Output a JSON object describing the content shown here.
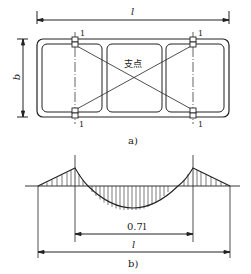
{
  "figure_a": {
    "caption": "a)",
    "length_label": "l",
    "width_label": "b",
    "support_label": "支点",
    "support_markers": [
      "1",
      "1",
      "1",
      "1"
    ]
  },
  "figure_b": {
    "caption": "b)",
    "span_label": "0.7l",
    "length_label": "l"
  },
  "colors": {
    "line": "#222222",
    "background": "#ffffff"
  }
}
